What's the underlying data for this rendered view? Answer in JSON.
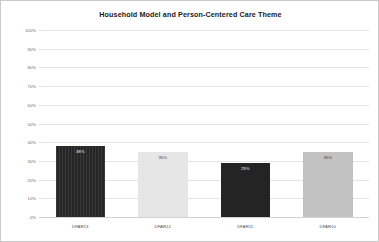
{
  "chart_data": {
    "type": "bar",
    "title": "Household Model and Person-Centered Care Theme",
    "xlabel": "",
    "ylabel": "",
    "ylim": [
      0,
      100
    ],
    "grid": true,
    "legend": false,
    "categories": [
      "DFAR13",
      "DFAR12",
      "DFAR11",
      "DFAR10"
    ],
    "values": [
      38,
      35,
      29,
      35
    ],
    "value_labels": [
      "38%",
      "35%",
      "29%",
      "35%"
    ],
    "ytick_labels": [
      "0%",
      "10%",
      "20%",
      "30%",
      "40%",
      "50%",
      "60%",
      "70%",
      "80%",
      "90%",
      "100%"
    ],
    "ytick_values": [
      0,
      10,
      20,
      30,
      40,
      50,
      60,
      70,
      80,
      90,
      100
    ],
    "bar_fills": [
      "dark-striped",
      "light-gray",
      "dark-solid",
      "medium-gray"
    ],
    "colors": {
      "bar_dark": "#262626",
      "bar_light": "#e6e6e6",
      "bar_dark_solid": "#242424",
      "bar_medium": "#c2c2c2",
      "gridline": "#e4e4e4",
      "title_text": "#1a1a1a",
      "tick_text": "#6d6d6d",
      "border": "#c9c9c9",
      "background": "#ffffff"
    }
  }
}
